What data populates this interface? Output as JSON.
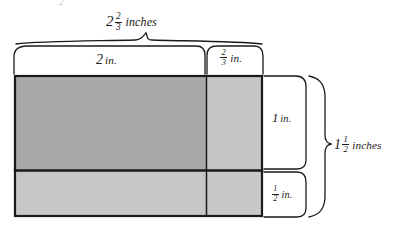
{
  "figure": {
    "title_top": "2 2/3 inches",
    "type": "area-model-rectangle"
  },
  "labels": {
    "top_total": {
      "whole": "2",
      "num": "2",
      "den": "3",
      "unit": "inches"
    },
    "top_left": {
      "whole": "2",
      "num": "",
      "den": "",
      "unit": "in."
    },
    "top_right": {
      "whole": "",
      "num": "2",
      "den": "3",
      "unit": "in."
    },
    "right_top": {
      "whole": "1",
      "num": "",
      "den": "",
      "unit": "in."
    },
    "right_bottom": {
      "whole": "",
      "num": "1",
      "den": "2",
      "unit": "in."
    },
    "right_total": {
      "whole": "1",
      "num": "1",
      "den": "2",
      "unit": "inches"
    }
  },
  "colors": {
    "ink": "#1a1a1a",
    "fill_dark": "#a8a8a8",
    "fill_light": "#c6c6c6",
    "fill_light_alt": "#c9c9c9",
    "background": "#ffffff"
  },
  "geometry": {
    "rect": {
      "x": 14,
      "y": 75,
      "width": 248,
      "height": 141
    },
    "v_divider_x": 206,
    "h_divider_y": 170,
    "cells": [
      {
        "name": "top-left",
        "width_label": "2 in.",
        "height_label": "1 in.",
        "shade": "dark"
      },
      {
        "name": "top-right",
        "width_label": "2/3 in.",
        "height_label": "1 in.",
        "shade": "light"
      },
      {
        "name": "bottom-left",
        "width_label": "2 in.",
        "height_label": "1/2 in.",
        "shade": "light"
      },
      {
        "name": "bottom-right",
        "width_label": "2/3 in.",
        "height_label": "1/2 in.",
        "shade": "light"
      }
    ]
  },
  "artifact": {
    "top_fragment": "2"
  }
}
